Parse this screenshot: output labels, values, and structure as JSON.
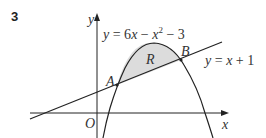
{
  "question_number": "3",
  "axes": {
    "x_label": "x",
    "y_label": "y",
    "origin_label": "O"
  },
  "curve": {
    "equation": "y = 6x − x² − 3",
    "parts": {
      "lhs": "y",
      "eq": " = 6",
      "x1": "x",
      "minus1": " − ",
      "x2": "x",
      "sup": "2",
      "rest": " − 3"
    }
  },
  "line": {
    "equation": "y = x + 1",
    "parts": {
      "lhs": "y",
      "eq": " = ",
      "x": "x",
      "rest": " + 1"
    }
  },
  "points": [
    {
      "label": "A"
    },
    {
      "label": "B"
    }
  ],
  "region": {
    "label": "R",
    "fill": "#dcdcdc"
  },
  "colors": {
    "stroke": "#222222",
    "text": "#333333"
  }
}
